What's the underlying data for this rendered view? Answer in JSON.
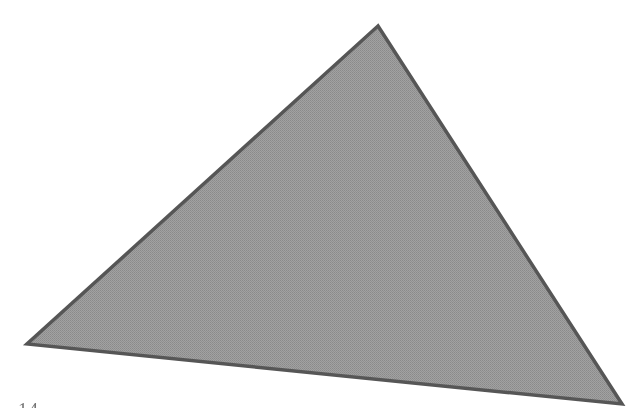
{
  "page": {
    "width": 637,
    "height": 417,
    "background_color": "#ffffff",
    "kind": "scanned-printed-figure"
  },
  "figure": {
    "name": "triangle-figure",
    "shape": "triangle",
    "fill_color": "#9a9a9a",
    "stroke_color": "#575757",
    "stroke_width": 3.5,
    "fill_texture": "halftone-dither",
    "vertices": [
      {
        "label": "apex",
        "x": 378,
        "y": 26
      },
      {
        "label": "left",
        "x": 27,
        "y": 344
      },
      {
        "label": "right",
        "x": 622,
        "y": 404
      }
    ],
    "points_attr": "378,26 27,344 622,404"
  },
  "caption": {
    "text": "14",
    "cropped": true
  }
}
